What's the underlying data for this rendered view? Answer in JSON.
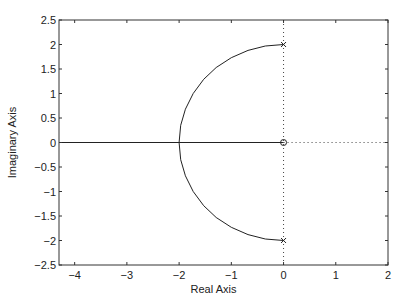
{
  "chart_data": {
    "type": "line",
    "title": "",
    "xlabel": "Real Axis",
    "ylabel": "Imaginary Axis",
    "xlim": [
      -4.3,
      2
    ],
    "ylim": [
      -2.5,
      2.5
    ],
    "xticks": [
      -4,
      -3,
      -2,
      -1,
      0,
      1,
      2
    ],
    "xtick_labels": [
      "−4",
      "−3",
      "−2",
      "−1",
      "0",
      "1",
      "2"
    ],
    "yticks": [
      2.5,
      2,
      1.5,
      1,
      0.5,
      0,
      -0.5,
      -1,
      -1.5,
      -2,
      -2.5
    ],
    "ytick_labels": [
      "2.5",
      "2",
      "1.5",
      "1",
      "0.5",
      "0",
      "−0.5",
      "−1",
      "−1.5",
      "−2",
      "−2.5"
    ],
    "grid": false,
    "legend": null,
    "poles": [
      {
        "re": 0,
        "im": 2
      },
      {
        "re": 0,
        "im": -2
      }
    ],
    "zeros": [
      {
        "re": 0,
        "im": 0
      }
    ],
    "series": [
      {
        "name": "upper-branch",
        "style": "solid",
        "points": [
          [
            0,
            2
          ],
          [
            -0.35,
            1.97
          ],
          [
            -0.68,
            1.88
          ],
          [
            -1,
            1.73
          ],
          [
            -1.29,
            1.53
          ],
          [
            -1.53,
            1.29
          ],
          [
            -1.73,
            1
          ],
          [
            -1.88,
            0.68
          ],
          [
            -1.97,
            0.35
          ],
          [
            -2,
            0
          ]
        ]
      },
      {
        "name": "lower-branch",
        "style": "solid",
        "points": [
          [
            0,
            -2
          ],
          [
            -0.35,
            -1.97
          ],
          [
            -0.68,
            -1.88
          ],
          [
            -1,
            -1.73
          ],
          [
            -1.29,
            -1.53
          ],
          [
            -1.53,
            -1.29
          ],
          [
            -1.73,
            -1
          ],
          [
            -1.88,
            -0.68
          ],
          [
            -1.97,
            -0.35
          ],
          [
            -2,
            0
          ]
        ]
      },
      {
        "name": "real-axis-branch",
        "style": "solid",
        "points": [
          [
            -4.3,
            0
          ],
          [
            0,
            0
          ]
        ]
      }
    ],
    "reference_lines": [
      {
        "name": "imag-axis",
        "style": "dotted",
        "points": [
          [
            0,
            -2.5
          ],
          [
            0,
            2.5
          ]
        ]
      },
      {
        "name": "positive-real-axis",
        "style": "dotted",
        "points": [
          [
            0,
            0
          ],
          [
            2,
            0
          ]
        ]
      }
    ]
  }
}
